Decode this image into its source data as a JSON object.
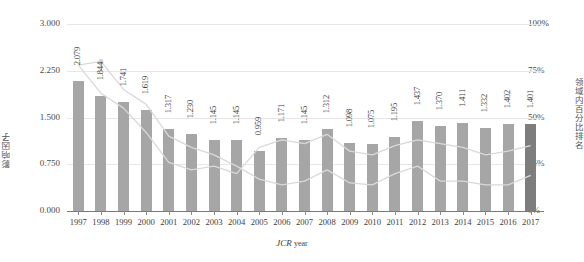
{
  "chart_data": {
    "type": "bar",
    "title": "",
    "xlabel": "JCR year",
    "ylabel": "影响因子",
    "y2label": "领域内百分比排名",
    "categories": [
      "1997",
      "1998",
      "1999",
      "2000",
      "2001",
      "2002",
      "2003",
      "2004",
      "2005",
      "2006",
      "2007",
      "2008",
      "2009",
      "2010",
      "2011",
      "2012",
      "2013",
      "2014",
      "2015",
      "2016",
      "2017"
    ],
    "values": [
      2.079,
      1.844,
      1.741,
      1.619,
      1.317,
      1.23,
      1.145,
      1.145,
      0.959,
      1.171,
      1.145,
      1.312,
      1.098,
      1.075,
      1.195,
      1.437,
      1.37,
      1.411,
      1.332,
      1.402,
      1.401
    ],
    "value_labels": [
      "2.079",
      "1.844",
      "1.741",
      "1.619",
      "1.317",
      "1.230",
      "1.145",
      "1.145",
      "0.959",
      "1.171",
      "1.145",
      "1.312",
      "1.098",
      "1.075",
      "1.195",
      "1.437",
      "1.370",
      "1.411",
      "1.332",
      "1.402",
      "1.401"
    ],
    "ylim": [
      0,
      3.0
    ],
    "yticks": [
      0,
      0.75,
      1.5,
      2.25,
      3.0
    ],
    "ytick_labels": [
      "0.000",
      "0.750",
      "1.500",
      "2.250",
      "3.000"
    ],
    "y2lim": [
      0,
      100
    ],
    "y2ticks": [
      0,
      25,
      50,
      75,
      100
    ],
    "y2tick_labels": [
      "0%",
      "25%",
      "50%",
      "75%",
      "100%"
    ],
    "grid": true,
    "legend": "none",
    "series": [
      {
        "name": "percentile-line-upper",
        "axis": "y2",
        "values": [
          78,
          80,
          65,
          57,
          40,
          34,
          30,
          24,
          17,
          14,
          16,
          22,
          15,
          14,
          20,
          24,
          16,
          16,
          14,
          14,
          19
        ]
      },
      {
        "name": "percentile-line-lower",
        "axis": "y2",
        "values": [
          78,
          63,
          55,
          42,
          26,
          22,
          24,
          20,
          34,
          38,
          36,
          41,
          32,
          30,
          35,
          38,
          36,
          34,
          30,
          32,
          35
        ]
      }
    ],
    "bar_color": "#a6a6a6",
    "last_bar_color": "#7d7d7d",
    "line_color": "#d9d9d9",
    "grid_color": "#e6e6e6",
    "axis_color": "#7a7a7a"
  },
  "axes": {
    "left_title": "影响因子",
    "right_title": "领域内百分比排名",
    "bottom_title_main": "JCR",
    "bottom_title_sub": "year"
  }
}
